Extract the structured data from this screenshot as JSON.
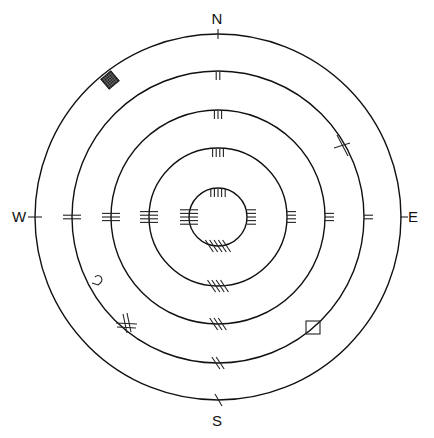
{
  "diagram": {
    "title": "",
    "center": {
      "x": 218,
      "y": 217
    },
    "stroke_color": "#111111",
    "compass": [
      {
        "id": "north",
        "label": "N",
        "x": 217,
        "y": 24
      },
      {
        "id": "south",
        "label": "S",
        "x": 217,
        "y": 426
      },
      {
        "id": "west",
        "label": "W",
        "x": 19,
        "y": 222
      },
      {
        "id": "east",
        "label": "E",
        "x": 413,
        "y": 222
      }
    ],
    "rings": [
      {
        "level": 1,
        "radius": 183,
        "tick_count": 1
      },
      {
        "level": 2,
        "radius": 146,
        "tick_count": 2
      },
      {
        "level": 3,
        "radius": 107,
        "tick_count": 3
      },
      {
        "level": 4,
        "radius": 69,
        "tick_count": 4
      },
      {
        "level": 5,
        "radius": 29,
        "tick_count": 5
      }
    ],
    "markers": [
      {
        "id": "filled-grid-square",
        "ring": 1,
        "x": 110,
        "y": 80
      },
      {
        "id": "cross-mark-ne",
        "ring": 2,
        "x": 343,
        "y": 145
      },
      {
        "id": "hook-mark",
        "ring": 1,
        "x": 97,
        "y": 283
      },
      {
        "id": "crossed-hash",
        "ring": 2,
        "x": 126,
        "y": 325
      },
      {
        "id": "open-square",
        "ring": 2,
        "x": 313,
        "y": 328
      }
    ]
  }
}
